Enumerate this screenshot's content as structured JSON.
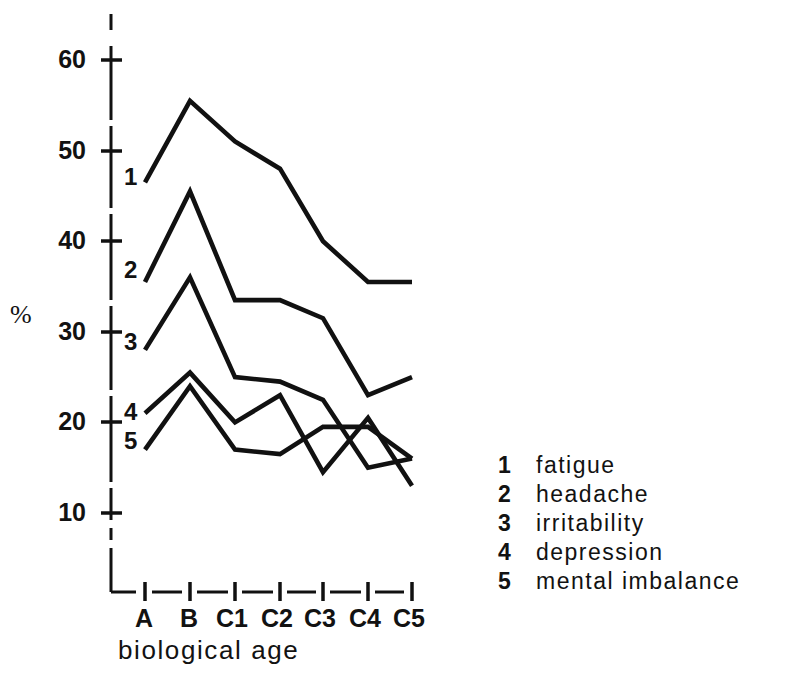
{
  "chart_data": {
    "type": "line",
    "title": "",
    "xlabel": "biological age",
    "ylabel": "%",
    "categories": [
      "A",
      "B",
      "C1",
      "C2",
      "C3",
      "C4",
      "C5"
    ],
    "yticks": [
      10,
      20,
      30,
      40,
      50,
      60
    ],
    "ylim": [
      6,
      63
    ],
    "grid": false,
    "legend_position": "right",
    "series": [
      {
        "name": "fatigue",
        "key": "1",
        "values": [
          46.5,
          55.5,
          51.0,
          48.0,
          40.0,
          35.5,
          35.5
        ]
      },
      {
        "name": "headache",
        "key": "2",
        "values": [
          35.5,
          45.5,
          33.5,
          33.5,
          31.5,
          23.0,
          25.0
        ]
      },
      {
        "name": "irritability",
        "key": "3",
        "values": [
          28.0,
          36.0,
          25.0,
          24.5,
          22.5,
          15.0,
          16.0
        ]
      },
      {
        "name": "depression",
        "key": "4",
        "values": [
          21.0,
          25.5,
          20.0,
          23.0,
          14.5,
          20.5,
          13.0
        ]
      },
      {
        "name": "mental imbalance",
        "key": "5",
        "values": [
          17.0,
          24.0,
          17.0,
          16.5,
          19.5,
          19.5,
          16.0
        ]
      }
    ],
    "line_color": "#111111",
    "axis_color": "#111111"
  },
  "axis": {
    "y_title": "%",
    "x_title": "biological age",
    "y_tick_labels": [
      "60",
      "50",
      "40",
      "30",
      "20",
      "10"
    ],
    "x_tick_labels": [
      "A",
      "B",
      "C1",
      "C2",
      "C3",
      "C4",
      "C5"
    ]
  },
  "series_markers": [
    {
      "label": "1"
    },
    {
      "label": "2"
    },
    {
      "label": "3"
    },
    {
      "label": "4"
    },
    {
      "label": "5"
    }
  ],
  "legend": {
    "items": [
      {
        "key": "1",
        "label": "fatigue"
      },
      {
        "key": "2",
        "label": "headache"
      },
      {
        "key": "3",
        "label": "irritability"
      },
      {
        "key": "4",
        "label": "depression"
      },
      {
        "key": "5",
        "label": "mental imbalance"
      }
    ]
  }
}
